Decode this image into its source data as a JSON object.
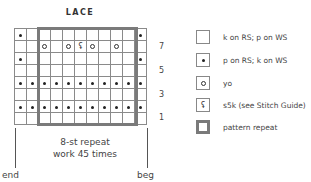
{
  "title": "LACE",
  "chart": {
    "columns": 11,
    "rows": [
      {
        "row": 8,
        "cells": [
          "dot",
          "",
          "",
          "",
          "",
          "",
          "",
          "",
          "",
          "",
          "dot"
        ]
      },
      {
        "row": 7,
        "cells": [
          "",
          "",
          "yo",
          "",
          "yo",
          "s5k",
          "yo",
          "",
          "yo",
          "",
          ""
        ]
      },
      {
        "row": 6,
        "cells": [
          "dot",
          "",
          "",
          "",
          "",
          "",
          "",
          "",
          "",
          "",
          "dot"
        ]
      },
      {
        "row": 5,
        "cells": [
          "",
          "",
          "",
          "",
          "",
          "",
          "",
          "",
          "",
          "",
          ""
        ]
      },
      {
        "row": 4,
        "cells": [
          "dot",
          "dot",
          "dot",
          "dot",
          "dot",
          "dot",
          "dot",
          "dot",
          "dot",
          "dot",
          "dot"
        ]
      },
      {
        "row": 3,
        "cells": [
          "",
          "",
          "",
          "",
          "",
          "",
          "",
          "",
          "",
          "",
          ""
        ]
      },
      {
        "row": 2,
        "cells": [
          "dot",
          "dot",
          "dot",
          "dot",
          "dot",
          "dot",
          "dot",
          "dot",
          "dot",
          "dot",
          "dot"
        ]
      },
      {
        "row": 1,
        "cells": [
          "",
          "",
          "",
          "",
          "",
          "",
          "",
          "",
          "",
          "",
          ""
        ]
      }
    ],
    "row_numbers": [
      "7",
      "5",
      "3",
      "1"
    ],
    "repeat": {
      "start_col": 3,
      "end_col": 10,
      "line1": "8-st repeat",
      "line2": "work 45 times"
    },
    "end_label": "end",
    "beg_label": "beg",
    "s5k_glyph": "⹛"
  },
  "legend": [
    {
      "symbol": "blank",
      "label": "k on RS; p on WS"
    },
    {
      "symbol": "dot",
      "label": "p on RS; k on WS"
    },
    {
      "symbol": "yo",
      "label": "yo"
    },
    {
      "symbol": "s5k",
      "label": "s5k (see Stitch Guide)"
    },
    {
      "symbol": "repeat",
      "label": "pattern repeat"
    }
  ],
  "colors": {
    "grid": "#8a8a8a",
    "repeat_border": "#7a7a7a",
    "text": "#444444"
  }
}
